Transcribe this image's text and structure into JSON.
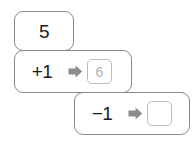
{
  "diagram": {
    "type": "function-machine-chain",
    "steps": [
      {
        "id": "start",
        "label": "5",
        "has_arrow": false,
        "result": null,
        "result_state": "none"
      },
      {
        "id": "add-one",
        "label": "+1",
        "has_arrow": true,
        "arrow_icon": "arrow-right-icon",
        "result": "6",
        "result_state": "filled"
      },
      {
        "id": "subtract-one",
        "label": "−1",
        "has_arrow": true,
        "arrow_icon": "arrow-right-icon",
        "result": "",
        "result_state": "empty"
      }
    ]
  },
  "colors": {
    "card_border": "#8a8a8a",
    "box_border": "#bdbdbd",
    "arrow_fill": "#8c8c8c",
    "label_text": "#1b1b1b",
    "result_text": "#b0b0b0",
    "background": "#ffffff"
  }
}
